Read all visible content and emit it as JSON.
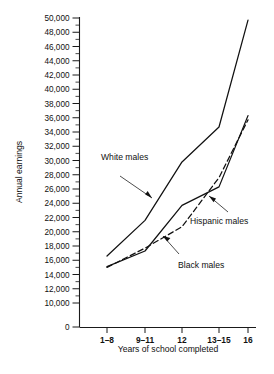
{
  "chart_data": {
    "type": "line",
    "title": "",
    "xlabel": "Years of school completed",
    "ylabel": "Annual earnings",
    "categories": [
      "1–8",
      "9–11",
      "12",
      "13–15",
      "16"
    ],
    "ylim": [
      10000,
      50000
    ],
    "y_axis_break_at_zero": true,
    "ytick_labels": [
      "0",
      "10,000",
      "12,000",
      "14,000",
      "16,000",
      "18,000",
      "20,000",
      "22,000",
      "24,000",
      "26,000",
      "28,000",
      "30,000",
      "32,000",
      "34,000",
      "36,000",
      "38,000",
      "40,000",
      "42,000",
      "44,000",
      "46,000",
      "48,000",
      "50,000"
    ],
    "ytick_values": [
      0,
      10000,
      12000,
      14000,
      16000,
      18000,
      20000,
      22000,
      24000,
      26000,
      28000,
      30000,
      32000,
      34000,
      36000,
      38000,
      40000,
      42000,
      44000,
      46000,
      48000,
      50000
    ],
    "ytick_step": 2000,
    "minor_ticks": true,
    "grid": false,
    "legend": "inline-annotations",
    "series": [
      {
        "name": "White males",
        "style": "solid",
        "color": "#111111",
        "values": [
          16600,
          21600,
          29800,
          34700,
          49700
        ]
      },
      {
        "name": "Hispanic males",
        "style": "solid",
        "color": "#111111",
        "values": [
          15100,
          17300,
          23700,
          26300,
          36300
        ]
      },
      {
        "name": "Black males",
        "style": "dashed",
        "color": "#111111",
        "values": [
          15000,
          17700,
          20700,
          27600,
          35700
        ]
      }
    ],
    "annotations": [
      {
        "text": "White males",
        "target_series": "White males"
      },
      {
        "text": "Hispanic males",
        "target_series": "Hispanic males"
      },
      {
        "text": "Black males",
        "target_series": "Black males"
      }
    ]
  }
}
